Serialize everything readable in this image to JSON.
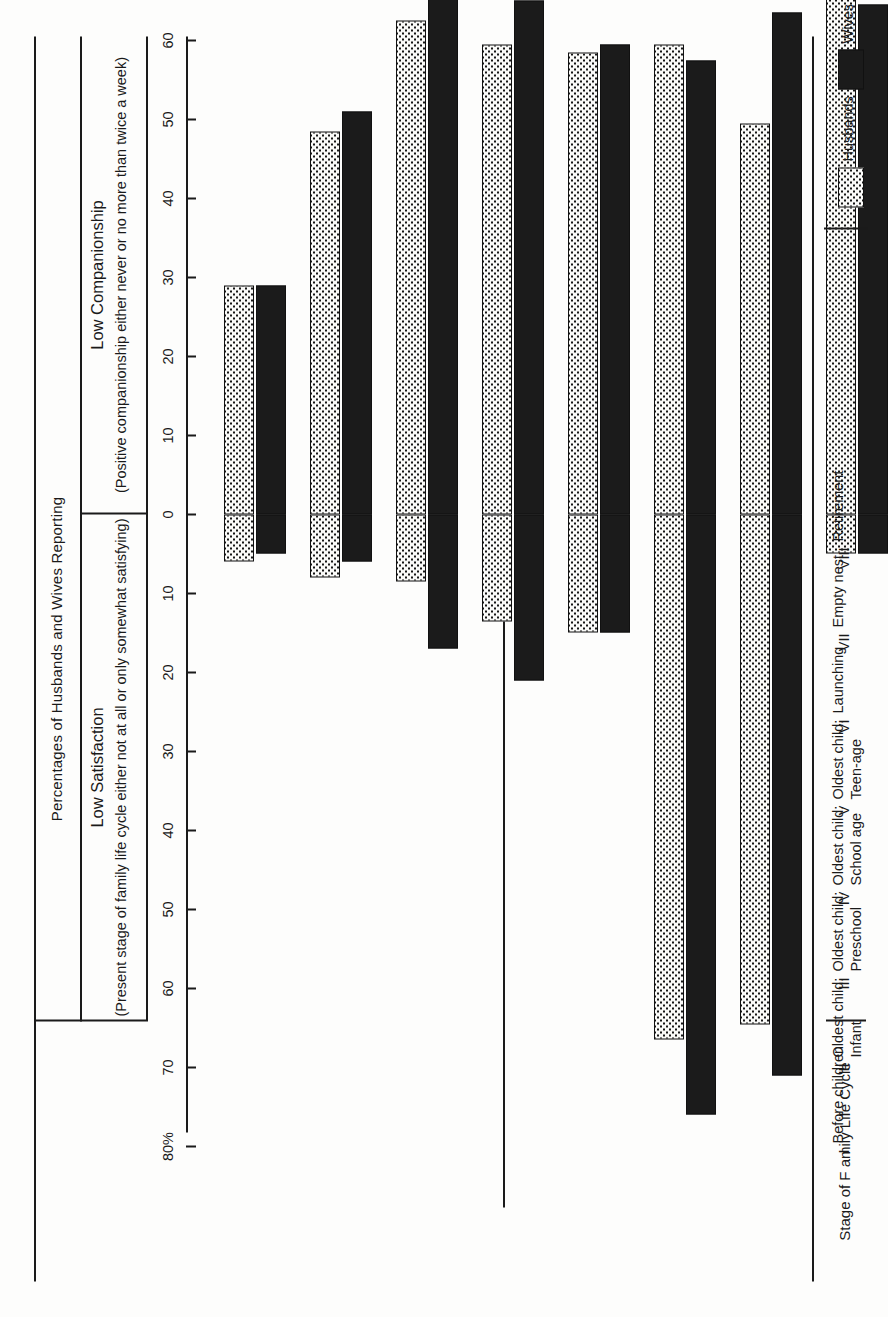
{
  "figure": {
    "header_title": "Percentages of Husbands and Wives Reporting",
    "left_section_title": "Low Satisfaction",
    "left_section_paren": "(Present stage of family life cycle either not at\nall or only somewhat satisfying)",
    "right_section_title": "Low Companionship",
    "right_section_paren": "(Positive companionship either never or no more\nthan twice a week)",
    "category_axis_title": "Stage of F amily Life Cycle"
  },
  "legend": {
    "items": [
      {
        "label": "Husbands",
        "swatch": "dotted-swatch",
        "color": "#fafaf8"
      },
      {
        "label": "Wives",
        "swatch": "solid-black-swatch",
        "color": "#1b1b1b"
      }
    ]
  },
  "axis": {
    "left_ticks": [
      "80%",
      "70",
      "60",
      "50",
      "40",
      "30",
      "20",
      "10",
      "0"
    ],
    "right_ticks": [
      "0",
      "10",
      "20",
      "30",
      "40",
      "50",
      "60",
      "70",
      "80%"
    ],
    "max": 80,
    "step": 10
  },
  "categories": [
    {
      "numeral": "I",
      "label": "Before children"
    },
    {
      "numeral": "II",
      "label": "Oldest child:\nInfant"
    },
    {
      "numeral": "III",
      "label": "Oldest child:\nPreschool"
    },
    {
      "numeral": "IV",
      "label": "Oldest child:\nSchool age"
    },
    {
      "numeral": "V",
      "label": "Oldest child:\nTeen-age"
    },
    {
      "numeral": "VI",
      "label": "Launching"
    },
    {
      "numeral": "VII",
      "label": "Empty nest"
    },
    {
      "numeral": "VIII",
      "label": "Retirement"
    }
  ],
  "chart_data": {
    "type": "bar",
    "title": "Percentages of Husbands and Wives Reporting",
    "orientation": "bidirectional-vertical",
    "xlabel": "Stage of F amily Life Cycle",
    "ylabel": "Percent",
    "ylim": [
      -80,
      80
    ],
    "grid": false,
    "legend_position": "bottom-right",
    "categories": [
      "I Before children",
      "II Oldest child: Infant",
      "III Oldest child: Preschool",
      "IV Oldest child: School age",
      "V Oldest child: Teen-age",
      "VI Launching",
      "VII Empty nest",
      "VIII Retirement"
    ],
    "panels": [
      {
        "name": "Low Companionship",
        "direction": "up",
        "note": "(Positive companionship either never or no more than twice a week)",
        "series": [
          {
            "name": "Husbands",
            "values": [
              29,
              48.5,
              62.5,
              59.5,
              58.5,
              59.5,
              49.5,
              68
            ]
          },
          {
            "name": "Wives",
            "values": [
              29,
              51,
              74,
              65,
              59.5,
              57.5,
              63.5,
              64.5
            ]
          }
        ]
      },
      {
        "name": "Low Satisfaction",
        "direction": "down",
        "note": "(Present stage of family life cycle either not at all or only somewhat satisfying)",
        "series": [
          {
            "name": "Husbands",
            "values": [
              6,
              8,
              8.5,
              13.5,
              15,
              66.5,
              64.5,
              5
            ]
          },
          {
            "name": "Wives",
            "values": [
              5,
              6,
              17,
              21,
              15,
              76,
              71,
              5
            ]
          }
        ]
      }
    ]
  }
}
